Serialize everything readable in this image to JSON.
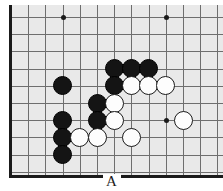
{
  "figure": {
    "kind": "go-board-diagram",
    "width": 223,
    "height": 191,
    "board_background": "#e9e9e9",
    "line_color": "#6e6e6e",
    "edge_color": "#1a1a1a"
  },
  "label": {
    "text": "A",
    "position": "bottom-center"
  },
  "board": {
    "columns": 13,
    "rows": 10,
    "spacing": 17.2,
    "origin_x": 2,
    "origin_y": 12,
    "star_points": [
      {
        "col": 3,
        "row": 0
      },
      {
        "col": 9,
        "row": 0
      },
      {
        "col": 9,
        "row": 6
      }
    ],
    "stones": [
      {
        "color": "black",
        "col": 3,
        "row": 4
      },
      {
        "color": "black",
        "col": 6,
        "row": 3
      },
      {
        "color": "black",
        "col": 7,
        "row": 3
      },
      {
        "color": "black",
        "col": 8,
        "row": 3
      },
      {
        "color": "black",
        "col": 6,
        "row": 4
      },
      {
        "color": "white",
        "col": 7,
        "row": 4
      },
      {
        "color": "white",
        "col": 8,
        "row": 4
      },
      {
        "color": "white",
        "col": 9,
        "row": 4
      },
      {
        "color": "black",
        "col": 5,
        "row": 5
      },
      {
        "color": "white",
        "col": 6,
        "row": 5
      },
      {
        "color": "black",
        "col": 3,
        "row": 6
      },
      {
        "color": "black",
        "col": 5,
        "row": 6
      },
      {
        "color": "white",
        "col": 6,
        "row": 6
      },
      {
        "color": "white",
        "col": 10,
        "row": 6
      },
      {
        "color": "black",
        "col": 3,
        "row": 7
      },
      {
        "color": "white",
        "col": 4,
        "row": 7
      },
      {
        "color": "white",
        "col": 5,
        "row": 7
      },
      {
        "color": "white",
        "col": 7,
        "row": 7
      },
      {
        "color": "black",
        "col": 3,
        "row": 8
      }
    ]
  }
}
